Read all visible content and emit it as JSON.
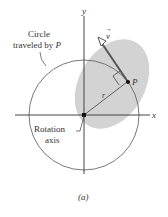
{
  "figure": {
    "labels": {
      "y_axis": "y",
      "x_axis": "x",
      "circle_label_line1": "Circle",
      "circle_label_line2": "traveled by ",
      "circle_label_P": "P",
      "point": "P",
      "radius": "r",
      "velocity": "v",
      "velocity_arrow": "→",
      "axis_label_line1": "Rotation",
      "axis_label_line2": "axis",
      "caption": "(a)"
    },
    "colors": {
      "axis": "#444444",
      "shaded_region": "#d3d3d3",
      "circle": "#555555",
      "text": "#333333"
    }
  }
}
